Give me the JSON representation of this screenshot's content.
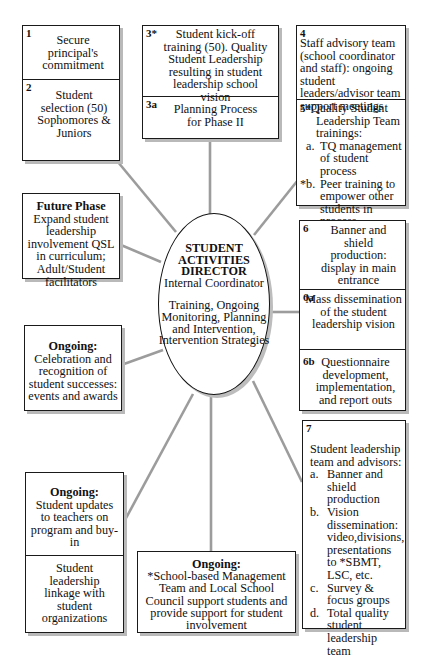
{
  "center": {
    "title_lines": [
      "STUDENT",
      "ACTIVITIES",
      "DIRECTOR"
    ],
    "subtitle": "Internal Coordinator",
    "description": "Training, Ongoing Monitoring, Planning and Intervention, Intervention Strategies"
  },
  "boxes": {
    "b1": {
      "num": "1",
      "text": "Secure principal's commitment"
    },
    "b2": {
      "num": "2",
      "text": "Student selection (50) Sophomores & Juniors"
    },
    "b3": {
      "num": "3*",
      "text": "Student kick-off training (50). Quality Student Leadership resulting in student leadership school vision"
    },
    "b3a": {
      "num": "3a",
      "text": "Planning Process for Phase II"
    },
    "b4": {
      "num": "4",
      "text": "Staff advisory team (school coordinator and staff): ongoing student leaders/advisor team support meetings"
    },
    "b5": {
      "num": "5*",
      "heading": "Quality Student Leadership Team trainings:",
      "items": [
        {
          "marker": "a.",
          "text": "TQ management of student process"
        },
        {
          "marker": "*b.",
          "text": "Peer training to empower other students in process"
        }
      ]
    },
    "future": {
      "heading": "Future Phase",
      "text": "Expand student leadership involvement QSL in curriculum; Adult/Student facilitators"
    },
    "celebration": {
      "heading": "Ongoing:",
      "text": "Celebration and recognition of student successes: events and awards"
    },
    "b6": {
      "num": "6",
      "text": "Banner and shield production: display in main entrance"
    },
    "b6a": {
      "num": "6a",
      "text": "Mass dissemination of the student leadership vision"
    },
    "b6b": {
      "num": "6b",
      "text": "Questionnaire development, implementation, and report outs"
    },
    "b7": {
      "num": "7",
      "heading": "Student leadership team and advisors:",
      "items": [
        {
          "marker": "a.",
          "text": "Banner and shield production"
        },
        {
          "marker": "b.",
          "text": "Vision dissemination: video,divisions, presentations to *SBMT, LSC, etc."
        },
        {
          "marker": "c.",
          "text": "Survey & focus groups"
        },
        {
          "marker": "d.",
          "text": "Total quality student leadership team"
        }
      ]
    },
    "updates": {
      "heading": "Ongoing:",
      "text": "Student updates to teachers on program and buy-in"
    },
    "linkage": {
      "text": "Student leadership linkage with student organizations"
    },
    "council": {
      "heading": "Ongoing:",
      "text": "*School-based Management Team and Local School Council support students and provide support for student involvement"
    }
  },
  "colors": {
    "line": "#9a9a9a",
    "border": "#1a1a1a",
    "shadow": "#b9b9b9"
  }
}
